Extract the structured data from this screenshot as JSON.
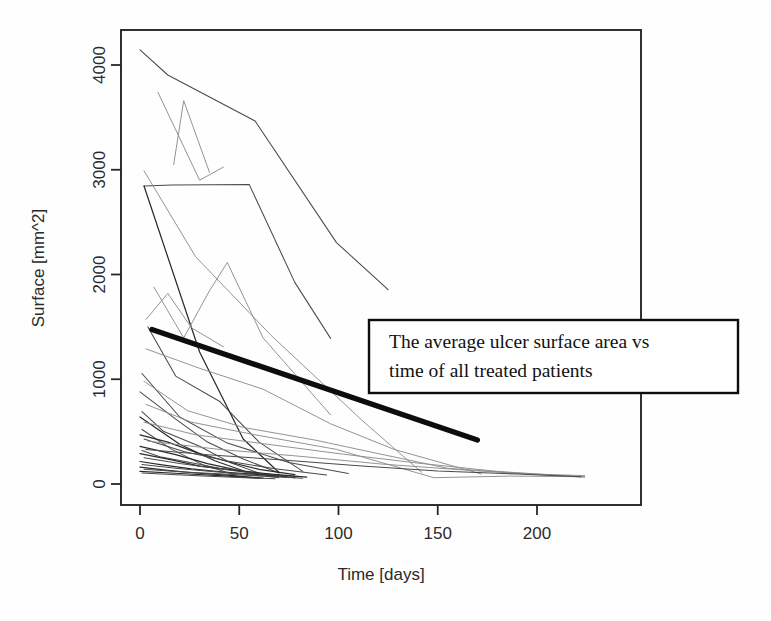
{
  "figure": {
    "background_color": "#fefefe",
    "plot_frame": {
      "x0": 121,
      "y0": 30,
      "x1": 641,
      "y1": 505,
      "color": "#262626"
    }
  },
  "annotation": {
    "line1": "The average ulcer surface area vs",
    "line2": "time of all treated patients",
    "box": {
      "x": 369,
      "y": 320,
      "width": 369,
      "height": 73
    },
    "border_color": "#0d0d0d",
    "fill_color": "#ffffff"
  },
  "chart_data": {
    "type": "line",
    "title": "",
    "xlabel": "Time [days]",
    "ylabel": "Surface [mm^2]",
    "xlim": [
      -7,
      235
    ],
    "ylim": [
      -150,
      4500
    ],
    "xticks": [
      0,
      50,
      100,
      150,
      200
    ],
    "yticks": [
      0,
      1000,
      2000,
      3000,
      4000
    ],
    "grid": false,
    "legend": false,
    "annotations": [
      {
        "text": "The average ulcer surface area vs time of all treated patients",
        "refers_to": "average-series",
        "x": 369,
        "y": 320
      }
    ],
    "series": [
      {
        "name": "average",
        "emphasis": "thick",
        "color": "#0d0d0d",
        "x": [
          6,
          170
        ],
        "values": [
          1475,
          420
        ]
      },
      {
        "name": "patient-01",
        "color": "#4a4a4a",
        "x": [
          0,
          14,
          58,
          99,
          125
        ],
        "values": [
          4145,
          3905,
          3465,
          2305,
          1855
        ]
      },
      {
        "name": "patient-02",
        "color": "#8d8d8d",
        "x": [
          9,
          30,
          42
        ],
        "values": [
          3740,
          2900,
          3025
        ]
      },
      {
        "name": "patient-03",
        "color": "#8d8d8d",
        "x": [
          17,
          22,
          35
        ],
        "values": [
          3050,
          3660,
          2975
        ]
      },
      {
        "name": "patient-04",
        "color": "#4a4a4a",
        "x": [
          2,
          16,
          55,
          78,
          96
        ],
        "values": [
          2845,
          2855,
          2860,
          1925,
          1390
        ]
      },
      {
        "name": "patient-05",
        "color": "#8d8d8d",
        "x": [
          2,
          28,
          66,
          112,
          142
        ],
        "values": [
          2990,
          2170,
          1420,
          605,
          110
        ]
      },
      {
        "name": "patient-06",
        "color": "#2b2b2b",
        "x": [
          2,
          30,
          52,
          70
        ],
        "values": [
          2845,
          1260,
          430,
          110
        ]
      },
      {
        "name": "patient-07",
        "color": "#8d8d8d",
        "x": [
          7,
          22,
          35,
          44,
          62,
          96
        ],
        "values": [
          1880,
          1395,
          1845,
          2115,
          1395,
          660
        ]
      },
      {
        "name": "patient-08",
        "color": "#8d8d8d",
        "x": [
          3,
          14,
          26,
          42
        ],
        "values": [
          1570,
          1820,
          1490,
          1310
        ]
      },
      {
        "name": "patient-09",
        "color": "#4a4a4a",
        "x": [
          4,
          18,
          40,
          60,
          82
        ],
        "values": [
          1500,
          1030,
          790,
          400,
          120
        ]
      },
      {
        "name": "patient-10",
        "color": "#8d8d8d",
        "x": [
          3,
          30,
          62,
          96,
          128,
          172
        ],
        "values": [
          1290,
          1105,
          905,
          575,
          330,
          95
        ]
      },
      {
        "name": "patient-11",
        "color": "#4a4a4a",
        "x": [
          1,
          20,
          44,
          75,
          105
        ],
        "values": [
          1055,
          640,
          390,
          205,
          100
        ]
      },
      {
        "name": "patient-12",
        "color": "#8d8d8d",
        "x": [
          2,
          24,
          52,
          88,
          120,
          155,
          196,
          224
        ],
        "values": [
          980,
          700,
          540,
          420,
          290,
          150,
          95,
          80
        ]
      },
      {
        "name": "patient-13",
        "color": "#4a4a4a",
        "x": [
          0,
          18,
          34,
          52,
          70
        ],
        "values": [
          880,
          620,
          400,
          240,
          105
        ]
      },
      {
        "name": "patient-14",
        "color": "#8d8d8d",
        "x": [
          3,
          26,
          58,
          99,
          148,
          186,
          224
        ],
        "values": [
          760,
          590,
          470,
          330,
          60,
          75,
          70
        ]
      },
      {
        "name": "patient-15",
        "color": "#4a4a4a",
        "x": [
          1,
          12,
          30,
          46,
          62
        ],
        "values": [
          690,
          500,
          360,
          200,
          90
        ]
      },
      {
        "name": "patient-16",
        "color": "#2b2b2b",
        "x": [
          0,
          20,
          38,
          56
        ],
        "values": [
          640,
          380,
          220,
          100
        ]
      },
      {
        "name": "patient-17",
        "color": "#8d8d8d",
        "x": [
          2,
          28,
          64,
          102,
          140,
          180,
          222
        ],
        "values": [
          590,
          470,
          380,
          285,
          200,
          120,
          70
        ]
      },
      {
        "name": "patient-18",
        "color": "#4a4a4a",
        "x": [
          1,
          16,
          32,
          48
        ],
        "values": [
          520,
          330,
          180,
          85
        ]
      },
      {
        "name": "patient-19",
        "color": "#2b2b2b",
        "x": [
          0,
          14,
          30,
          44,
          60,
          78
        ],
        "values": [
          470,
          400,
          290,
          215,
          140,
          90
        ]
      },
      {
        "name": "patient-20",
        "color": "#4a4a4a",
        "x": [
          2,
          22,
          44,
          68,
          94
        ],
        "values": [
          430,
          310,
          220,
          145,
          85
        ]
      },
      {
        "name": "patient-21",
        "color": "#2b2b2b",
        "x": [
          0,
          18,
          34,
          52,
          72
        ],
        "values": [
          360,
          280,
          195,
          120,
          70
        ]
      },
      {
        "name": "patient-22",
        "color": "#4a4a4a",
        "x": [
          1,
          10,
          24,
          40,
          58,
          80
        ],
        "values": [
          320,
          260,
          210,
          150,
          105,
          70
        ]
      },
      {
        "name": "patient-23",
        "color": "#2b2b2b",
        "x": [
          0,
          16,
          30,
          48,
          66,
          84
        ],
        "values": [
          290,
          230,
          170,
          130,
          95,
          65
        ]
      },
      {
        "name": "patient-24",
        "color": "#4a4a4a",
        "x": [
          2,
          20,
          38,
          56,
          74
        ],
        "values": [
          250,
          195,
          150,
          105,
          70
        ]
      },
      {
        "name": "patient-25",
        "color": "#2b2b2b",
        "x": [
          0,
          12,
          26,
          42,
          60,
          78
        ],
        "values": [
          215,
          180,
          145,
          115,
          90,
          60
        ]
      },
      {
        "name": "patient-26",
        "color": "#4a4a4a",
        "x": [
          1,
          18,
          36,
          54,
          70
        ],
        "values": [
          185,
          150,
          120,
          90,
          60
        ]
      },
      {
        "name": "patient-27",
        "color": "#2b2b2b",
        "x": [
          0,
          14,
          28,
          44,
          62
        ],
        "values": [
          160,
          130,
          105,
          85,
          55
        ]
      },
      {
        "name": "patient-28",
        "color": "#4a4a4a",
        "x": [
          2,
          22,
          42,
          62,
          82
        ],
        "values": [
          140,
          115,
          95,
          75,
          55
        ]
      },
      {
        "name": "patient-29",
        "color": "#2b2b2b",
        "x": [
          0,
          20,
          40,
          60
        ],
        "values": [
          120,
          100,
          80,
          55
        ]
      },
      {
        "name": "patient-30",
        "color": "#4a4a4a",
        "x": [
          1,
          16,
          32,
          50,
          68
        ],
        "values": [
          105,
          90,
          75,
          62,
          50
        ]
      },
      {
        "name": "patient-31",
        "color": "#8d8d8d",
        "x": [
          4,
          40,
          80,
          122,
          166,
          206,
          224
        ],
        "values": [
          410,
          330,
          265,
          190,
          130,
          85,
          65
        ]
      },
      {
        "name": "patient-32",
        "color": "#4a4a4a",
        "x": [
          3,
          34,
          72,
          110,
          150,
          190,
          222
        ],
        "values": [
          330,
          280,
          230,
          175,
          125,
          95,
          70
        ]
      }
    ]
  }
}
